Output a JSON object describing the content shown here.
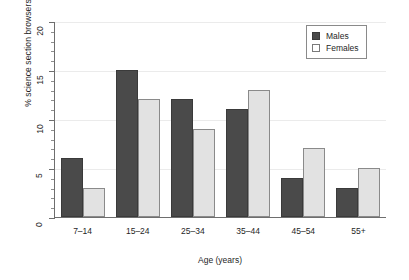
{
  "chart_data": {
    "type": "bar",
    "title": "",
    "xlabel": "Age (years)",
    "ylabel": "% science section browsers",
    "categories": [
      "7–14",
      "15–24",
      "25–34",
      "35–44",
      "45–54",
      "55+"
    ],
    "series": [
      {
        "name": "Males",
        "values": [
          6,
          15,
          12,
          11,
          4,
          3
        ],
        "color": "#4a4a4a"
      },
      {
        "name": "Females",
        "values": [
          3,
          12,
          9,
          13,
          7,
          5
        ],
        "color": "#e2e2e2"
      }
    ],
    "ylim": [
      0,
      20
    ],
    "ytick_labels": [
      "0",
      "5",
      "10",
      "15",
      "20"
    ],
    "ytick_values": [
      0,
      5,
      10,
      15,
      20
    ],
    "yminor_step": 1,
    "grid": true,
    "grid_axis": "y",
    "legend_position": "top-right",
    "legend_entries": [
      "Males",
      "Females"
    ]
  }
}
